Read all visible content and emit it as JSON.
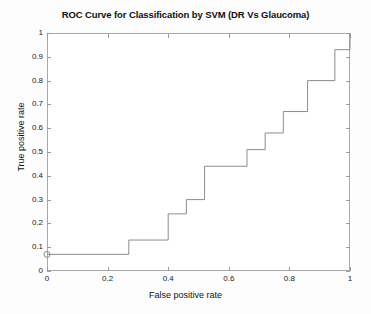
{
  "chart_data": {
    "type": "line",
    "title": "ROC Curve for Classification by SVM (DR Vs Glaucoma)",
    "xlabel": "False positive rate",
    "ylabel": "True positive rate",
    "xlim": [
      0,
      1
    ],
    "ylim": [
      0,
      1
    ],
    "grid": false,
    "legend": null,
    "xticks": [
      "0",
      "0.2",
      "0.4",
      "0.6",
      "0.8",
      "1"
    ],
    "xtick_values": [
      0,
      0.2,
      0.4,
      0.6,
      0.8,
      1
    ],
    "yticks": [
      "0",
      "0.1",
      "0.2",
      "0.3",
      "0.4",
      "0.5",
      "0.6",
      "0.7",
      "0.8",
      "0.9",
      "1"
    ],
    "ytick_values": [
      0,
      0.1,
      0.2,
      0.3,
      0.4,
      0.5,
      0.6,
      0.7,
      0.8,
      0.9,
      1
    ],
    "line_color": "#8c8c8c",
    "frame_color": "#a9a9a9",
    "marker": {
      "shape": "circle",
      "x": 0,
      "y": 0.07,
      "label": "operating-point"
    },
    "series": [
      {
        "name": "ROC (DR Vs Glaucoma)",
        "style": "step-post",
        "x": [
          0.0,
          0.27,
          0.27,
          0.4,
          0.4,
          0.46,
          0.46,
          0.52,
          0.52,
          0.66,
          0.66,
          0.72,
          0.72,
          0.78,
          0.78,
          0.86,
          0.86,
          0.95,
          0.95,
          1.0
        ],
        "y": [
          0.07,
          0.07,
          0.13,
          0.13,
          0.24,
          0.24,
          0.3,
          0.3,
          0.44,
          0.44,
          0.51,
          0.51,
          0.58,
          0.58,
          0.67,
          0.67,
          0.8,
          0.8,
          0.93,
          0.93
        ]
      }
    ],
    "final_point": {
      "x": 1.0,
      "y": 1.0
    }
  },
  "figure": {
    "background": "#fdfdfd",
    "plot_background": "#ffffff"
  }
}
